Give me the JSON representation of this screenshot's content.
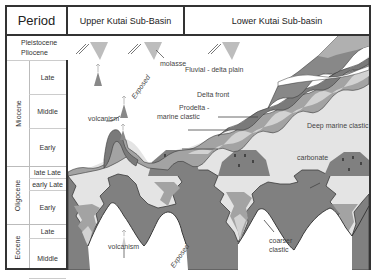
{
  "header": {
    "period": "Period",
    "upper_basin": "Upper Kutai Sub-Basin",
    "lower_basin": "Lower Kutai Sub-basin"
  },
  "timescale": {
    "pleistocene": "Pleistocene",
    "pliocene": "Pliocene",
    "epochs": [
      {
        "name": "Miocene",
        "subs": [
          "Late",
          "Middle",
          "Early"
        ]
      },
      {
        "name": "Oligocene",
        "subs": [
          "late Late",
          "early Late",
          "Early"
        ]
      },
      {
        "name": "Eocene",
        "subs": [
          "Late",
          "Middle",
          "Early"
        ]
      }
    ]
  },
  "labels": {
    "molasse": "molasse",
    "volcanism_upper": "volcanism",
    "exposed_upper": "Exposed",
    "fluvial": "Fluvial - delta plain",
    "delta_front": "Delta front",
    "prodelta_1": "Prodelta -",
    "prodelta_2": "marine clastic",
    "deep_marine": "Deep marine clastic",
    "carbonate": "carbonate",
    "volcanism_lower": "volcanism",
    "exposed_lower": "Exposed",
    "coarser_1": "coarser",
    "coarser_2": "clastic"
  },
  "colors": {
    "border": "#333333",
    "dark_fill": "#7a7a7a",
    "mid_fill": "#a3a3a3",
    "light_fill": "#d2d2d2",
    "deep_marine": "#e4e4e4",
    "outline": "#3a3a3a"
  }
}
